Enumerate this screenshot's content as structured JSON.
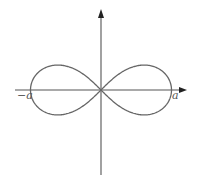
{
  "diagram": {
    "type": "lemniscate of Bernoulli",
    "equation": "r^2 = a^2 cos(2θ)",
    "colors": {
      "curve": "#666666",
      "axes": "#555555",
      "arrow": "#222222",
      "labels": "#555555"
    },
    "axes": {
      "x_arrow": true,
      "y_arrow": true
    },
    "labels": {
      "left_intercept": "−a",
      "right_intercept": "a"
    }
  }
}
